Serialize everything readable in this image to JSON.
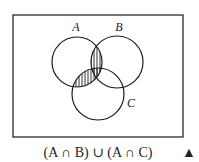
{
  "diagram": {
    "type": "venn",
    "universe": {
      "x": 13,
      "y": 15,
      "width": 170,
      "height": 122
    },
    "sets": [
      {
        "id": "A",
        "label": "A",
        "cx": 77,
        "cy": 62,
        "r": 25,
        "label_x": 76,
        "label_y": 30
      },
      {
        "id": "B",
        "label": "B",
        "cx": 117,
        "cy": 62,
        "r": 26,
        "label_x": 117,
        "label_y": 30
      },
      {
        "id": "C",
        "label": "C",
        "cx": 98,
        "cy": 94,
        "r": 26,
        "label_x": 128,
        "label_y": 107
      }
    ],
    "shaded_regions": [
      "A∩B",
      "A∩C"
    ],
    "shading_style": "vertical-hatch",
    "caption": "(A ∩ B) ∪ (A ∩ C)",
    "marker": "▲",
    "colors": {
      "stroke": "#1a1a1a",
      "background": "#ffffff"
    }
  }
}
